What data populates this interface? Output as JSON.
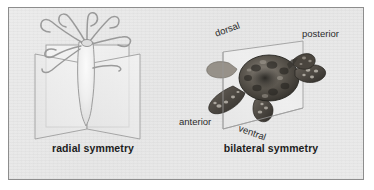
{
  "figure": {
    "background_color": "#e9e9e9",
    "border_color": "#8d8d8d",
    "page_color": "#ffffff"
  },
  "panels": [
    {
      "id": "radial",
      "caption": "radial symmetry",
      "organism": "sea-anemone",
      "organism_description": "sea anemone with radiating curled tentacles",
      "plane_count": 2,
      "plane_description": "two intersecting vertical planes through the central axis",
      "direction_labels": []
    },
    {
      "id": "bilateral",
      "caption": "bilateral symmetry",
      "organism": "sea-turtle",
      "organism_description": "sea turtle viewed from above on a single sagittal plane",
      "plane_count": 1,
      "plane_description": "single sagittal plane dividing left and right halves",
      "direction_labels": [
        {
          "text": "dorsal",
          "rotation": -20
        },
        {
          "text": "posterior",
          "rotation": 0
        },
        {
          "text": "anterior",
          "rotation": 0
        },
        {
          "text": "ventral",
          "rotation": 20
        }
      ]
    }
  ],
  "colors": {
    "plane_stroke": "#9b9b9b",
    "plane_fill": "#f2f2f2",
    "organism_line": "#9a9a9a",
    "label_text": "#2b2b2b",
    "caption_text": "#1d1d1d",
    "turtle_dark": "#3a3732",
    "turtle_mid": "#6d6760",
    "turtle_light": "#a9a39a"
  }
}
